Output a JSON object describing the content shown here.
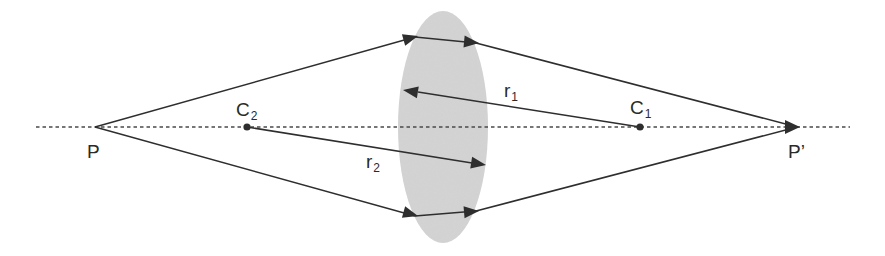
{
  "diagram": {
    "colors": {
      "background": "#ffffff",
      "lens_fill": "#d4d4d4",
      "line": "#2e2e2e",
      "axis": "#4a4a4a",
      "text": "#2a2a2a"
    },
    "optical_axis": {
      "x1": 36,
      "x2": 850,
      "y": 127,
      "style": "dotted"
    },
    "lens": {
      "cx": 443,
      "cy": 127,
      "rx": 45,
      "ry": 116
    },
    "points": {
      "object": {
        "label": "P",
        "x": 95,
        "y": 127
      },
      "image": {
        "label": "P",
        "prime": "’",
        "x": 797,
        "y": 127
      },
      "center1": {
        "label": "C",
        "sub": "1",
        "x": 640,
        "y": 127
      },
      "center2": {
        "label": "C",
        "sub": "2",
        "x": 247,
        "y": 127
      }
    },
    "radii": {
      "r1": {
        "label": "r",
        "sub": "1",
        "from": "C1",
        "to_x": 403,
        "to_y": 91
      },
      "r2": {
        "label": "r",
        "sub": "2",
        "from": "C2",
        "to_x": 485,
        "to_y": 165
      }
    },
    "rays": [
      {
        "name": "upper-ray",
        "points": [
          [
            95,
            127
          ],
          [
            415,
            37
          ],
          [
            476,
            43
          ],
          [
            797,
            127
          ]
        ]
      },
      {
        "name": "lower-ray",
        "points": [
          [
            95,
            127
          ],
          [
            415,
            216
          ],
          [
            476,
            211
          ],
          [
            797,
            127
          ]
        ]
      }
    ]
  }
}
